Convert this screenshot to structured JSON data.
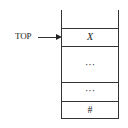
{
  "diagram": {
    "type": "stack",
    "pointer": {
      "label": "TOP",
      "points_to": 0
    },
    "cells": [
      {
        "label": "X",
        "italic": true
      },
      {
        "label": "···"
      },
      {
        "label": "···"
      },
      {
        "label": "#"
      }
    ]
  }
}
